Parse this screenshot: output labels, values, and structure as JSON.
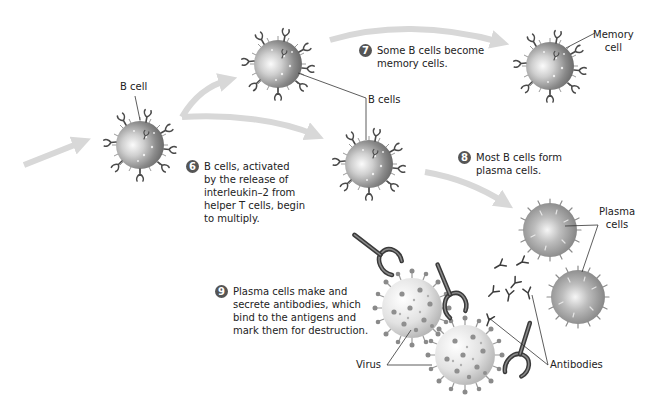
{
  "labels": {
    "b_cell": "B cell",
    "b_cells": "B cells",
    "memory_cell": "Memory\ncell",
    "plasma_cells": "Plasma\ncells",
    "antibodies": "Antibodies",
    "virus": "Virus"
  },
  "steps": [
    {
      "number": "6",
      "text": "B cells, activated\nby the release of\ninterleukin–2 from\nhelper T cells, begin\nto multiply."
    },
    {
      "number": "7",
      "text": "Some B cells become\nmemory cells."
    },
    {
      "number": "8",
      "text": "Most B cells form\nplasma cells."
    },
    {
      "number": "9",
      "text": "Plasma cells make and\nsecrete antibodies, which\nbind to the antigens and\nmark them for destruction."
    }
  ],
  "colors": {
    "arrow": "#d8d8d8",
    "cell_dark": "#6e6e6e",
    "cell_light": "#f2f2f2",
    "receptor": "#4a4a4a",
    "step_badge": "#555555",
    "virus_body": "#e4e4e4",
    "virus_spike": "#8a8a8a"
  }
}
